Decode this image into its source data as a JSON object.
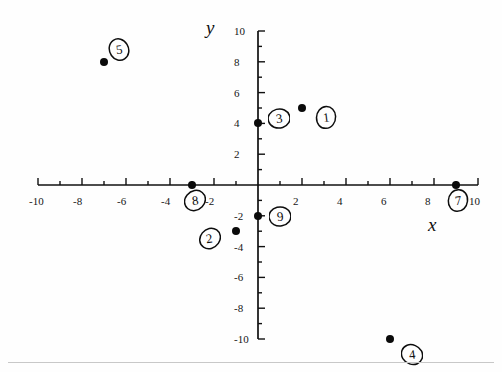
{
  "figure": {
    "kind": "hand-annotated-coordinate-plane",
    "x_axis_name": "x",
    "y_axis_name": "y"
  },
  "chart_data": {
    "type": "scatter",
    "title": "",
    "xlabel": "x",
    "ylabel": "y",
    "xlim": [
      -10,
      10
    ],
    "ylim": [
      -10,
      10
    ],
    "grid": false,
    "legend": "none",
    "x_major_step": 2,
    "x_minor_step": 1,
    "y_major_step": 2,
    "y_minor_step": 1,
    "x_tick_labels": [
      "-10",
      "-8",
      "-6",
      "-4",
      "-2",
      "2",
      "4",
      "6",
      "8",
      "10"
    ],
    "x_tick_values": [
      -10,
      -8,
      -6,
      -4,
      -2,
      2,
      4,
      6,
      8,
      10
    ],
    "y_tick_labels": [
      "10",
      "8",
      "6",
      "4",
      "2",
      "-2",
      "-4",
      "-6",
      "-8",
      "-10"
    ],
    "y_tick_values": [
      10,
      8,
      6,
      4,
      2,
      -2,
      -4,
      -6,
      -8,
      -10
    ],
    "points": [
      {
        "label": "1",
        "x": 2,
        "y": 5,
        "label_dx": 1.1,
        "label_dy": 0.6
      },
      {
        "label": "2",
        "x": -1,
        "y": -3,
        "label_dx": -1.2,
        "label_dy": 0.45
      },
      {
        "label": "3",
        "x": 0,
        "y": 4,
        "label_dx": 0.95,
        "label_dy": -0.35
      },
      {
        "label": "4",
        "x": 6,
        "y": -10,
        "label_dx": 1.0,
        "label_dy": 1.0
      },
      {
        "label": "5",
        "x": -7,
        "y": 8,
        "label_dx": 0.7,
        "label_dy": -0.8
      },
      {
        "label": "7",
        "x": 9,
        "y": 0,
        "label_dx": 0.1,
        "label_dy": 1.0
      },
      {
        "label": "8",
        "x": -3,
        "y": 0,
        "label_dx": 0.15,
        "label_dy": 1.0
      },
      {
        "label": "9",
        "x": 0,
        "y": -2,
        "label_dx": 1.0,
        "label_dy": 0.0
      }
    ]
  }
}
